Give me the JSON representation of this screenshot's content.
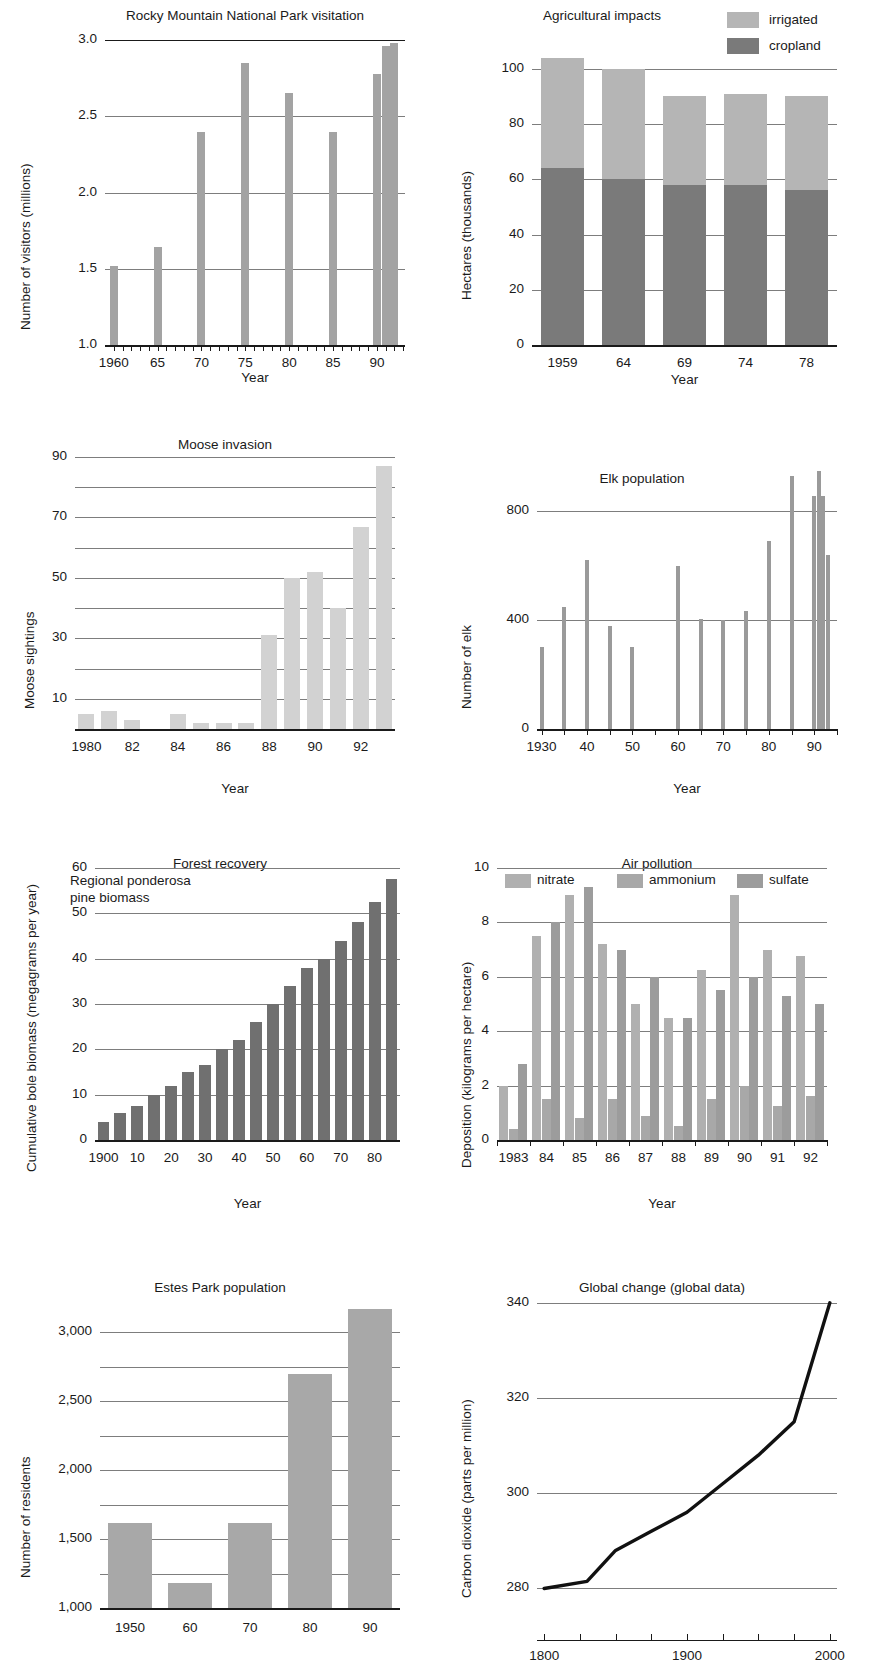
{
  "figure": {
    "panel_count": 8
  },
  "colors": {
    "light_gray": "#c9c9c9",
    "mid_gray": "#a3a3a3",
    "dark_gray": "#7a7a7a",
    "darker_gray": "#6e6e6e",
    "axis": "#1a1a1a",
    "gridline": "#7d7d7d"
  },
  "charts": [
    {
      "id": "rmnp-visitation",
      "chart_data": {
        "type": "bar",
        "title": "Rocky Mountain National Park visitation",
        "xlabel": "Year",
        "ylabel": "Number of visitors (millions)",
        "categories": [
          "1960",
          "65",
          "70",
          "75",
          "80",
          "85",
          "90",
          "91",
          "92"
        ],
        "x": [
          1960,
          1965,
          1970,
          1975,
          1980,
          1985,
          1990,
          1991,
          1992
        ],
        "values": [
          1.52,
          1.64,
          2.4,
          2.85,
          2.65,
          2.4,
          2.78,
          2.96,
          2.98
        ],
        "yticks": [
          "1.0",
          "1.5",
          "2.0",
          "2.5",
          "3.0"
        ],
        "ytick_values": [
          1.0,
          1.5,
          2.0,
          2.5,
          3.0
        ],
        "xticks": [
          "1960",
          "65",
          "70",
          "75",
          "80",
          "85",
          "90"
        ],
        "ylim": [
          1.0,
          3.0
        ],
        "xlim": [
          1959,
          1993
        ],
        "grid": true,
        "legend": null,
        "color": "#a3a3a3"
      }
    },
    {
      "id": "agricultural-impacts",
      "chart_data": {
        "type": "bar",
        "subtype": "stacked",
        "title": "Agricultural impacts",
        "xlabel": "Year",
        "ylabel": "Hectares (thousands)",
        "categories": [
          "1959",
          "64",
          "69",
          "74",
          "78"
        ],
        "series": [
          {
            "name": "cropland",
            "values": [
              64,
              60,
              58,
              58,
              56
            ],
            "color": "#7a7a7a"
          },
          {
            "name": "irrigated",
            "values": [
              40,
              40,
              32,
              33,
              34
            ],
            "color": "#b5b5b5"
          }
        ],
        "totals": [
          104,
          100,
          90,
          91,
          90
        ],
        "yticks": [
          "0",
          "20",
          "40",
          "60",
          "80",
          "100"
        ],
        "ytick_values": [
          0,
          20,
          40,
          60,
          80,
          100
        ],
        "xticks": [
          "1959",
          "64",
          "69",
          "74",
          "78"
        ],
        "ylim": [
          0,
          105
        ],
        "grid": true,
        "legend": {
          "position": "top-right",
          "entries": [
            "irrigated",
            "cropland"
          ]
        }
      }
    },
    {
      "id": "moose-invasion",
      "chart_data": {
        "type": "bar",
        "title": "Moose invasion",
        "xlabel": "Year",
        "ylabel": "Moose sightings",
        "categories": [
          "1980",
          "81",
          "82",
          "83",
          "84",
          "85",
          "86",
          "87",
          "88",
          "89",
          "90",
          "91",
          "92",
          "93"
        ],
        "x": [
          1980,
          1981,
          1982,
          1983,
          1984,
          1985,
          1986,
          1987,
          1988,
          1989,
          1990,
          1991,
          1992,
          1993
        ],
        "values": [
          5,
          6,
          3,
          0,
          5,
          2,
          2,
          2,
          31,
          50,
          52,
          40,
          67,
          87
        ],
        "yticks": [
          "10",
          "30",
          "50",
          "70",
          "90"
        ],
        "ytick_values": [
          10,
          30,
          50,
          70,
          90
        ],
        "minor_ytick_values": [
          20,
          40,
          60,
          80
        ],
        "xticks": [
          "1980",
          "82",
          "84",
          "86",
          "88",
          "90",
          "92"
        ],
        "ylim": [
          0,
          90
        ],
        "grid": true,
        "legend": null,
        "color": "#d2d2d2"
      }
    },
    {
      "id": "elk-population",
      "chart_data": {
        "type": "bar",
        "title": "Elk population",
        "xlabel": "Year",
        "ylabel": "Number of elk",
        "categories": [
          "1930",
          "35",
          "40",
          "45",
          "50",
          "60",
          "65",
          "70",
          "75",
          "80",
          "85",
          "90",
          "91",
          "92",
          "93"
        ],
        "x": [
          1930,
          1935,
          1940,
          1945,
          1950,
          1960,
          1965,
          1970,
          1975,
          1980,
          1985,
          1990,
          1991,
          1992,
          1993
        ],
        "values": [
          300,
          450,
          620,
          380,
          300,
          600,
          405,
          400,
          435,
          690,
          930,
          855,
          950,
          855,
          640
        ],
        "yticks": [
          "0",
          "400",
          "800"
        ],
        "ytick_values": [
          0,
          400,
          800
        ],
        "xticks": [
          "1930",
          "40",
          "50",
          "60",
          "70",
          "80",
          "90"
        ],
        "ylim": [
          0,
          1000
        ],
        "xlim": [
          1929,
          1995
        ],
        "grid": true,
        "legend": null,
        "color": "#9a9a9a"
      }
    },
    {
      "id": "forest-recovery",
      "chart_data": {
        "type": "bar",
        "title": "Forest recovery",
        "annotation": "Regional ponderosa\npine biomass",
        "xlabel": "Year",
        "ylabel": "Cumulative bole biomass\n(megagrams per year)",
        "categories": [
          "1900",
          "05",
          "10",
          "15",
          "20",
          "25",
          "30",
          "35",
          "40",
          "45",
          "50",
          "55",
          "60",
          "65",
          "70",
          "75",
          "80",
          "85"
        ],
        "x": [
          1900,
          1905,
          1910,
          1915,
          1920,
          1925,
          1930,
          1935,
          1940,
          1945,
          1950,
          1955,
          1960,
          1965,
          1970,
          1975,
          1980,
          1985
        ],
        "values": [
          4,
          6,
          7.5,
          10,
          12,
          15,
          16.5,
          20,
          22,
          26,
          30,
          34,
          38,
          40,
          44,
          48,
          52.5,
          57.5
        ],
        "yticks": [
          "0",
          "10",
          "20",
          "30",
          "40",
          "50",
          "60"
        ],
        "ytick_values": [
          0,
          10,
          20,
          30,
          40,
          50,
          60
        ],
        "xticks": [
          "1900",
          "10",
          "20",
          "30",
          "40",
          "50",
          "60",
          "70",
          "80"
        ],
        "ylim": [
          0,
          60
        ],
        "grid": true,
        "legend": null,
        "color": "#707070"
      }
    },
    {
      "id": "air-pollution",
      "chart_data": {
        "type": "bar",
        "subtype": "grouped",
        "title": "Air pollution",
        "xlabel": "Year",
        "ylabel": "Deposition (kilograms per hectare)",
        "categories": [
          "1983",
          "84",
          "85",
          "86",
          "87",
          "88",
          "89",
          "90",
          "91",
          "92"
        ],
        "series": [
          {
            "name": "nitrate",
            "values": [
              2.0,
              7.5,
              9.0,
              7.2,
              5.0,
              4.5,
              6.25,
              9.0,
              7.0,
              6.75
            ],
            "color": "#b0b0b0"
          },
          {
            "name": "ammonium",
            "values": [
              0.4,
              1.5,
              0.8,
              1.5,
              0.9,
              0.5,
              1.5,
              2.0,
              1.25,
              1.6
            ],
            "color": "#a8a8a8"
          },
          {
            "name": "sulfate",
            "values": [
              2.8,
              8.0,
              9.3,
              7.0,
              6.0,
              4.5,
              5.5,
              6.0,
              5.3,
              5.0
            ],
            "color": "#9c9c9c"
          }
        ],
        "yticks": [
          "0",
          "2",
          "4",
          "6",
          "8",
          "10"
        ],
        "ytick_values": [
          0,
          2,
          4,
          6,
          8,
          10
        ],
        "xticks": [
          "1983",
          "84",
          "85",
          "86",
          "87",
          "88",
          "89",
          "90",
          "91",
          "92"
        ],
        "ylim": [
          0,
          10
        ],
        "grid": true,
        "legend": {
          "position": "top",
          "entries": [
            "nitrate",
            "ammonium",
            "sulfate"
          ]
        }
      }
    },
    {
      "id": "estes-park-population",
      "chart_data": {
        "type": "bar",
        "title": "Estes Park population",
        "xlabel": "Year",
        "ylabel": "Number of residents",
        "categories": [
          "1950",
          "60",
          "70",
          "80",
          "90"
        ],
        "values": [
          1620,
          1180,
          1620,
          2700,
          3170
        ],
        "yticks": [
          "1,000",
          "1,500",
          "2,000",
          "2,500",
          "3,000"
        ],
        "ytick_values": [
          1000,
          1500,
          2000,
          2500,
          3000
        ],
        "minor_ytick_values": [
          1250,
          1750,
          2250,
          2750
        ],
        "xticks": [
          "1950",
          "60",
          "70",
          "80",
          "90"
        ],
        "ylim": [
          1000,
          3250
        ],
        "grid": true,
        "legend": null,
        "color": "#a8a8a8"
      }
    },
    {
      "id": "global-change",
      "chart_data": {
        "type": "line",
        "title": "Global change (global data)",
        "xlabel": "Year",
        "ylabel": "Carbon dioxide (parts per million)",
        "x": [
          1800,
          1830,
          1850,
          1875,
          1900,
          1925,
          1950,
          1975,
          2000
        ],
        "values": [
          280,
          281.5,
          288,
          292,
          296,
          302,
          308,
          315,
          340
        ],
        "yticks": [
          "280",
          "300",
          "320",
          "340"
        ],
        "ytick_values": [
          280,
          300,
          320,
          340
        ],
        "xticks": [
          "1800",
          "1900",
          "2000"
        ],
        "xtick_values": [
          1800,
          1900,
          2000
        ],
        "minor_xtick_values": [
          1825,
          1850,
          1875,
          1925,
          1950,
          1975
        ],
        "ylim": [
          278,
          341
        ],
        "xlim": [
          1795,
          2005
        ],
        "grid": true,
        "legend": null,
        "color": "#111111"
      }
    }
  ]
}
